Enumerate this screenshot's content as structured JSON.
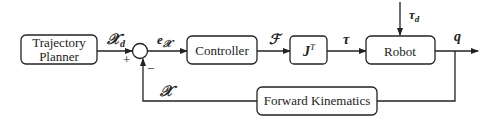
{
  "diagram": {
    "blocks": {
      "planner_line1": "Trajectory",
      "planner_line2": "Planner",
      "controller": "Controller",
      "jacobian": "J",
      "jacobian_sup": "T",
      "robot": "Robot",
      "forward_kinematics": "Forward Kinematics"
    },
    "signals": {
      "desired_pose": "𝒳",
      "desired_pose_sub": "d",
      "error": "e",
      "error_sub": "𝒳",
      "force": "ℱ",
      "torque": "τ",
      "disturbance": "τ",
      "disturbance_sub": "d",
      "joint_output": "q",
      "feedback": "𝒳"
    },
    "summing_junction": {
      "plus": "+",
      "minus": "−"
    }
  }
}
